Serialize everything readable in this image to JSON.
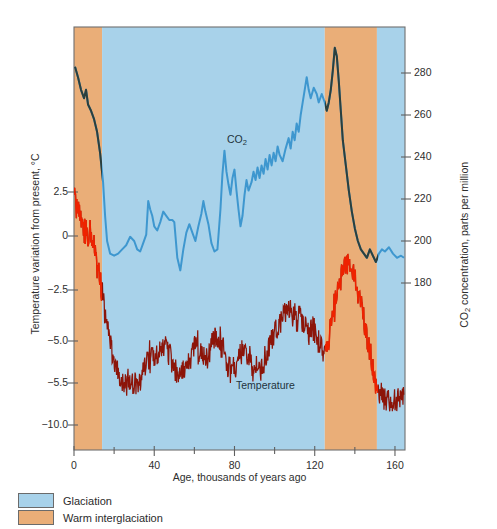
{
  "chart_data": {
    "type": "line",
    "title": "",
    "xlabel": "Age, thousands of years ago",
    "ylabel_left": "Temperature variation from present, °C",
    "ylabel_right": "CO₂ concentration, parts per million",
    "xlim": [
      0,
      165
    ],
    "xticks": [
      0,
      40,
      80,
      120,
      160
    ],
    "xticks_minor": [
      20,
      60,
      100,
      140
    ],
    "ylim_left": [
      -11.5,
      5.0
    ],
    "yticks_left": [
      "2.5",
      "0",
      "−2.5",
      "−5.0",
      "−5.5",
      "−10.0"
    ],
    "yticks_left_values": [
      2.5,
      0,
      -2.5,
      -5.0,
      -5.5,
      -10.0
    ],
    "ylim_right": [
      155,
      300
    ],
    "yticks_right": [
      280,
      260,
      240,
      220,
      200,
      180
    ],
    "grid": false,
    "legend_position": "below-left",
    "series": [
      {
        "name": "CO2",
        "label": "CO₂",
        "axis": "right",
        "color": "#3e97cf",
        "color_interglacial": "#2c3f3c",
        "label_x": 227,
        "label_y": 133,
        "values": [
          [
            0.5,
            283
          ],
          [
            2.0,
            278
          ],
          [
            3.5,
            272
          ],
          [
            5.0,
            268
          ],
          [
            6.0,
            272
          ],
          [
            7.0,
            265
          ],
          [
            8.5,
            262
          ],
          [
            10.0,
            258
          ],
          [
            11.5,
            252
          ],
          [
            13.0,
            242
          ],
          [
            14.5,
            228
          ],
          [
            15.5,
            212
          ],
          [
            16.5,
            200
          ],
          [
            18.0,
            194
          ],
          [
            20.0,
            193
          ],
          [
            22.0,
            194
          ],
          [
            24.0,
            196
          ],
          [
            26.0,
            198
          ],
          [
            28.0,
            202
          ],
          [
            30.0,
            200
          ],
          [
            31.5,
            196
          ],
          [
            33.0,
            195
          ],
          [
            34.5,
            199
          ],
          [
            36.0,
            203
          ],
          [
            37.0,
            219
          ],
          [
            38.0,
            215
          ],
          [
            39.0,
            212
          ],
          [
            40.0,
            207
          ],
          [
            41.5,
            205
          ],
          [
            43.0,
            209
          ],
          [
            44.5,
            214
          ],
          [
            46.0,
            212
          ],
          [
            47.5,
            210
          ],
          [
            49.0,
            210
          ],
          [
            50.0,
            209
          ],
          [
            51.5,
            192
          ],
          [
            53.0,
            186
          ],
          [
            54.5,
            196
          ],
          [
            56.0,
            204
          ],
          [
            57.5,
            208
          ],
          [
            59.0,
            204
          ],
          [
            60.5,
            200
          ],
          [
            62.0,
            207
          ],
          [
            63.5,
            213
          ],
          [
            64.5,
            219
          ],
          [
            65.5,
            214
          ],
          [
            67.0,
            208
          ],
          [
            68.5,
            199
          ],
          [
            70.0,
            195
          ],
          [
            71.5,
            196
          ],
          [
            73.0,
            215
          ],
          [
            74.0,
            232
          ],
          [
            75.0,
            243
          ],
          [
            76.0,
            233
          ],
          [
            77.0,
            227
          ],
          [
            78.0,
            222
          ],
          [
            79.0,
            230
          ],
          [
            80.0,
            234
          ],
          [
            81.0,
            224
          ],
          [
            82.0,
            215
          ],
          [
            83.0,
            207
          ],
          [
            84.0,
            212
          ],
          [
            85.0,
            222
          ],
          [
            86.0,
            229
          ],
          [
            87.0,
            224
          ],
          [
            88.5,
            228
          ],
          [
            89.5,
            233
          ],
          [
            90.5,
            229
          ],
          [
            91.5,
            235
          ],
          [
            92.5,
            230
          ],
          [
            93.5,
            236
          ],
          [
            94.5,
            232
          ],
          [
            95.5,
            239
          ],
          [
            96.5,
            234
          ],
          [
            97.5,
            241
          ],
          [
            98.5,
            236
          ],
          [
            99.5,
            242
          ],
          [
            100.5,
            238
          ],
          [
            101.5,
            245
          ],
          [
            102.5,
            241
          ],
          [
            104.0,
            238
          ],
          [
            105.5,
            244
          ],
          [
            107.0,
            249
          ],
          [
            108.0,
            244
          ],
          [
            109.0,
            252
          ],
          [
            110.0,
            248
          ],
          [
            111.0,
            256
          ],
          [
            112.0,
            252
          ],
          [
            113.0,
            260
          ],
          [
            114.0,
            266
          ],
          [
            115.0,
            272
          ],
          [
            116.0,
            278
          ],
          [
            117.0,
            272
          ],
          [
            118.0,
            268
          ],
          [
            119.5,
            273
          ],
          [
            121.0,
            270
          ],
          [
            122.0,
            266
          ],
          [
            123.5,
            270
          ],
          [
            125.0,
            266
          ],
          [
            126.0,
            262
          ],
          [
            127.0,
            266
          ],
          [
            128.0,
            272
          ],
          [
            129.0,
            281
          ],
          [
            130.0,
            292
          ],
          [
            131.0,
            288
          ],
          [
            132.0,
            276
          ],
          [
            133.0,
            262
          ],
          [
            134.0,
            248
          ],
          [
            135.5,
            236
          ],
          [
            137.0,
            224
          ],
          [
            138.5,
            214
          ],
          [
            140.0,
            206
          ],
          [
            141.5,
            200
          ],
          [
            143.0,
            196
          ],
          [
            144.5,
            194
          ],
          [
            146.0,
            192
          ],
          [
            147.5,
            196
          ],
          [
            149.0,
            193
          ],
          [
            150.5,
            190
          ],
          [
            152.0,
            194
          ],
          [
            153.5,
            196
          ],
          [
            155.0,
            195
          ],
          [
            157.0,
            197
          ],
          [
            159.0,
            194
          ],
          [
            161.0,
            192
          ],
          [
            163.0,
            193
          ],
          [
            164.5,
            192
          ]
        ]
      },
      {
        "name": "Temperature",
        "label": "Temperature",
        "axis": "left",
        "color": "#8c1509",
        "color_interglacial": "#ee2200",
        "label_x": 236,
        "label_y": 379
      }
    ],
    "bands": [
      {
        "label": "Warm interglaciation",
        "x_start": 0,
        "x_end": 14,
        "color": "#eaae78"
      },
      {
        "label": "Glaciation",
        "x_start": 14,
        "x_end": 125,
        "color": "#a8d2ea"
      },
      {
        "label": "Warm interglaciation",
        "x_start": 125,
        "x_end": 151,
        "color": "#eaae78"
      },
      {
        "label": "Glaciation",
        "x_start": 151,
        "x_end": 165,
        "color": "#a8d2ea"
      }
    ]
  },
  "legend": {
    "items": [
      {
        "label": "Glaciation",
        "color": "#a8d2ea"
      },
      {
        "label": "Warm interglaciation",
        "color": "#eaae78"
      }
    ]
  },
  "axes": {
    "x_label": "Age, thousands of years ago",
    "y_left_label_pre": "Temperature variation from present, °C",
    "y_right_label_pre": "CO",
    "y_right_label_sub": "2",
    "y_right_label_post": " concentration, parts per million",
    "x_ticks": [
      "0",
      "40",
      "80",
      "120",
      "160"
    ],
    "y_left_ticks": [
      "2.5",
      "0",
      "−2.5",
      "−5.0",
      "−5.5",
      "−10.0"
    ],
    "y_right_ticks": [
      "280",
      "260",
      "240",
      "220",
      "200",
      "180"
    ]
  },
  "annotations": {
    "co2_pre": "CO",
    "co2_sub": "2",
    "temperature": "Temperature"
  },
  "colors": {
    "glaciation": "#a8d2ea",
    "interglacial": "#eaae78",
    "co2_blue": "#3e97cf",
    "co2_dark": "#2c3f3c",
    "temp_dark": "#8c1509",
    "temp_bright": "#ee2200",
    "axis": "#6f6f6f"
  }
}
